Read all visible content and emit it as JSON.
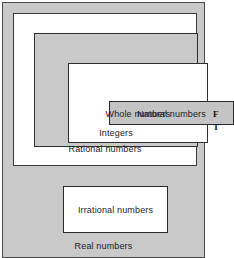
{
  "figure": {
    "name": "number-sets-nested-diagram",
    "colors": {
      "shaded_fill": "#c9c9c9",
      "plain_fill": "#ffffff",
      "border": "#2f2f2f",
      "text": "#1c1c1c"
    },
    "sets": {
      "real": "Real numbers",
      "rational": "Rational numbers",
      "integers": "Integers",
      "whole": "Whole numbers",
      "natural": "Natural numbers",
      "irrational": "Irrational numbers"
    }
  },
  "caption": {
    "line1": "F",
    "line2": "T"
  }
}
